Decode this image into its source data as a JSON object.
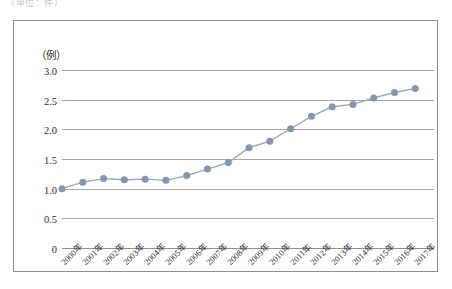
{
  "page": {
    "clipped_header_text": "（単位：件）"
  },
  "chart_data": {
    "type": "line",
    "title": "",
    "xlabel": "",
    "ylabel": "（例）",
    "ylim": [
      0,
      3.0
    ],
    "yticks": [
      "0",
      "0.5",
      "1.0",
      "1.5",
      "2.0",
      "2.5",
      "3.0"
    ],
    "ytick_values": [
      0,
      0.5,
      1.0,
      1.5,
      2.0,
      2.5,
      3.0
    ],
    "grid": true,
    "legend": "none",
    "marker": "circle",
    "series_color": "#8697ad",
    "line_color": "#9aa7b8",
    "categories": [
      "2000年",
      "2001年",
      "2002年",
      "2003年",
      "2004年",
      "2005年",
      "2006年",
      "2007年",
      "2008年",
      "2009年",
      "2010年",
      "2011年",
      "2012年",
      "2013年",
      "2014年",
      "2015年",
      "2016年",
      "2017年"
    ],
    "values": [
      1.0,
      1.11,
      1.17,
      1.15,
      1.16,
      1.14,
      1.22,
      1.33,
      1.44,
      1.69,
      1.8,
      2.01,
      2.22,
      2.38,
      2.42,
      2.53,
      2.62,
      2.69
    ]
  }
}
